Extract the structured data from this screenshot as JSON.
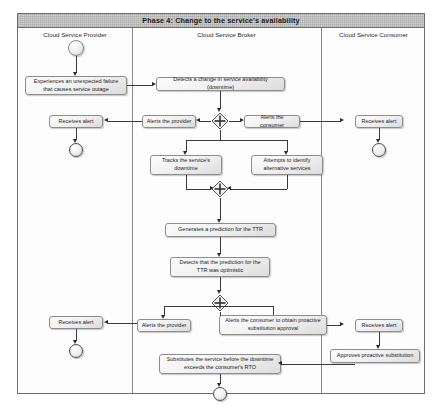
{
  "diagram": {
    "phase_banner": "Phase 4: Change to the service's availability",
    "lanes": [
      {
        "id": "provider",
        "title": "Cloud Service Provider"
      },
      {
        "id": "broker",
        "title": "Cloud Service Broker"
      },
      {
        "id": "consumer",
        "title": "Cloud Service Consumer"
      }
    ],
    "nodes": {
      "initial_node": "initial-node",
      "provider_failure": "Experiences an unexpected failure that causes service outage",
      "broker_detects_change": "Detects a change in service availability (downtime)",
      "fork_1": "fork-node",
      "alerts_provider_1": "Alerts the provider",
      "alerts_consumer_1": "Alerts the consumer",
      "provider_receives_alert_1": "Receives alert",
      "consumer_receives_alert_1": "Receives alert",
      "tracks_downtime": "Tracks the service's downtime",
      "identify_alternatives": "Attempts to identify alternative services",
      "join_1": "join-node",
      "generates_prediction": "Generates a prediction for the TTR",
      "detects_optimistic": "Detects that the prediction for the TTR was optimistic",
      "fork_2": "fork-node",
      "alerts_provider_2": "Alerts the provider",
      "alerts_consumer_2": "Alerts the consumer to obtain proactive substitution approval",
      "provider_receives_alert_2": "Receives alert",
      "consumer_receives_alert_2": "Receives alert",
      "approves_substitution": "Approves proactive substitution",
      "substitutes_service": "Substitutes the service before the downtime exceeds the consumer's RTO",
      "final_node": "activity-final-node"
    },
    "colors": {
      "frame_border": "#6e6e6e",
      "banner_bg": "#d2d2d2",
      "node_border": "#8d8d8d",
      "flow_line": "#3a3a3a",
      "text": "#1c1c1c"
    }
  }
}
